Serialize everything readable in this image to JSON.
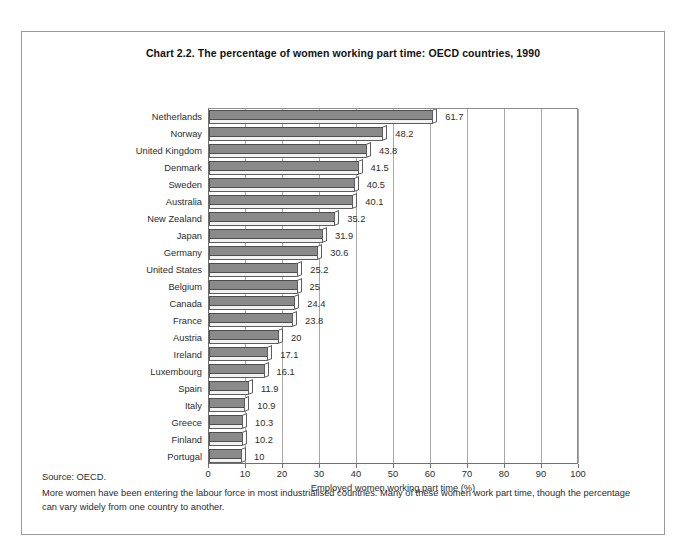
{
  "chart_data": {
    "type": "bar",
    "orientation": "horizontal",
    "title": "Chart 2.2.  The percentage of women working part time: OECD countries, 1990",
    "xlabel": "Employed women working part time (%)",
    "ylabel": "",
    "xlim": [
      0,
      100
    ],
    "xticks": [
      0,
      10,
      20,
      30,
      40,
      50,
      60,
      70,
      80,
      90,
      100
    ],
    "xtick_labels": [
      "0",
      "10",
      "20",
      "30",
      "40",
      "50",
      "60",
      "70",
      "80",
      "90",
      "100"
    ],
    "grid": true,
    "grid_axis": "x",
    "legend": false,
    "bar_style": "3d-ribbon",
    "bar_color": "#8a8a8a",
    "categories": [
      "Netherlands",
      "Norway",
      "United Kingdom",
      "Denmark",
      "Sweden",
      "Australia",
      "New Zealand",
      "Japan",
      "Germany",
      "United States",
      "Belgium",
      "Canada",
      "France",
      "Austria",
      "Ireland",
      "Luxembourg",
      "Spain",
      "Italy",
      "Greece",
      "Finland",
      "Portugal"
    ],
    "values": [
      61.7,
      48.2,
      43.8,
      41.5,
      40.5,
      40.1,
      35.2,
      31.9,
      30.6,
      25.2,
      25,
      24.4,
      23.8,
      20,
      17.1,
      16.1,
      11.9,
      10.9,
      10.3,
      10.2,
      10
    ],
    "value_labels": [
      "61.7",
      "48.2",
      "43.8",
      "41.5",
      "40.5",
      "40.1",
      "35.2",
      "31.9",
      "30.6",
      "25.2",
      "25",
      "24.4",
      "23.8",
      "20",
      "17.1",
      "16.1",
      "11.9",
      "10.9",
      "10.3",
      "10.2",
      "10"
    ]
  },
  "notes": {
    "source": "Source: OECD.",
    "caption": "More women have been entering the labour force in most industrialised countries. Many of these women work part time, though the percentage can vary widely from one country to another."
  }
}
